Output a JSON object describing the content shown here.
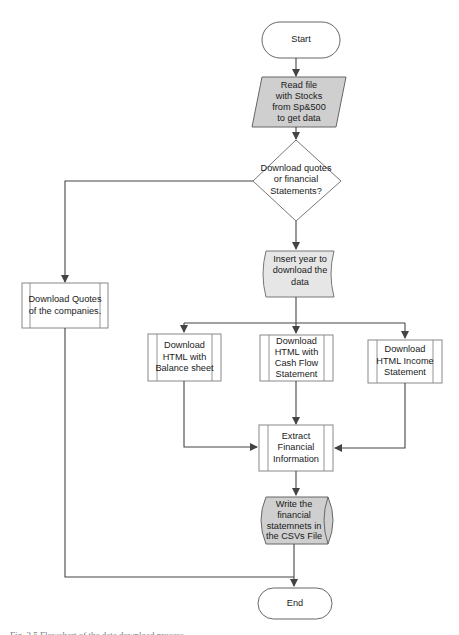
{
  "diagram": {
    "type": "flowchart",
    "colors": {
      "stroke": "#555555",
      "shaded_fill": "#cfcfcf",
      "light_fill": "#e8e8e8",
      "white_fill": "#ffffff"
    },
    "nodes": {
      "start": {
        "shape": "terminator",
        "label": "Start"
      },
      "read_file": {
        "shape": "data-parallelogram",
        "label": "Read file\nwith Stocks\nfrom Sp&500\nto get data"
      },
      "decision": {
        "shape": "diamond",
        "label": "Download quotes\nor  financial\nStatements?"
      },
      "insert_year": {
        "shape": "manual-input-card",
        "label": "Insert year to\ndownload the\ndata"
      },
      "download_quotes": {
        "shape": "predefined-process",
        "label": "Download  Quotes\nof the companies."
      },
      "balance_sheet": {
        "shape": "predefined-process",
        "label": "Download\nHTML with\nBalance sheet"
      },
      "cash_flow": {
        "shape": "predefined-process",
        "label": "Download\nHTML with\nCash Flow\nStatement"
      },
      "income_statement": {
        "shape": "predefined-process",
        "label": "Download\nHTML Income\nStatement"
      },
      "extract": {
        "shape": "predefined-process",
        "label": "Extract\nFinancial\nInformation"
      },
      "write_csv": {
        "shape": "stored-data-cylinder",
        "label": "Write the\nfinancial\nstatemnets in\nthe CSVs File"
      },
      "end": {
        "shape": "terminator",
        "label": "End"
      }
    },
    "edges": [
      [
        "start",
        "read_file"
      ],
      [
        "read_file",
        "decision"
      ],
      [
        "decision",
        "download_quotes"
      ],
      [
        "decision",
        "insert_year"
      ],
      [
        "insert_year",
        "balance_sheet"
      ],
      [
        "insert_year",
        "cash_flow"
      ],
      [
        "insert_year",
        "income_statement"
      ],
      [
        "balance_sheet",
        "extract"
      ],
      [
        "cash_flow",
        "extract"
      ],
      [
        "income_statement",
        "extract"
      ],
      [
        "extract",
        "write_csv"
      ],
      [
        "write_csv",
        "end"
      ],
      [
        "download_quotes",
        "end"
      ]
    ]
  },
  "caption": "Fig. 3.5  Flowchart of the data download process"
}
